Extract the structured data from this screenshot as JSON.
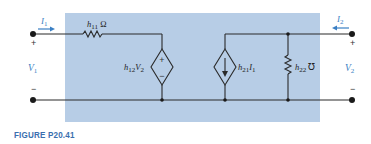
{
  "figure": {
    "caption": "FIGURE P20.41"
  },
  "colors": {
    "box_fill": "#b7cde6",
    "wire": "#2a2a2a",
    "arrow": "#3a7fc4",
    "caption": "#3a6fae"
  },
  "port1": {
    "current_label": "I",
    "current_sub": "1",
    "voltage_label": "V",
    "voltage_sub": "1",
    "plus": "+",
    "minus": "−"
  },
  "port2": {
    "current_label": "I",
    "current_sub": "2",
    "voltage_label": "V",
    "voltage_sub": "2",
    "plus": "+",
    "minus": "−"
  },
  "components": {
    "h11": {
      "label": "h",
      "sub": "11",
      "unit": " Ω",
      "type": "resistor"
    },
    "h12": {
      "label": "h",
      "sub": "12",
      "var": "V",
      "var_sub": "2",
      "type": "dependent-voltage-source",
      "plus": "+",
      "minus": "−"
    },
    "h21": {
      "label": "h",
      "sub": "21",
      "var": "I",
      "var_sub": "1",
      "type": "dependent-current-source"
    },
    "h22": {
      "label": "h",
      "sub": "22",
      "unit": " ℧",
      "type": "conductance"
    }
  }
}
